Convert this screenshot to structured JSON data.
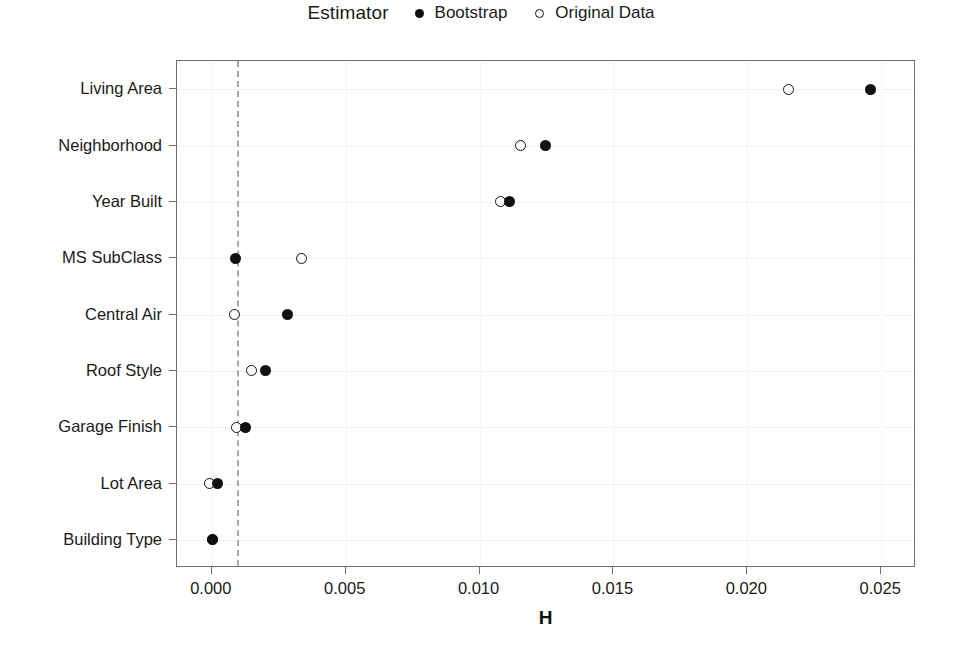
{
  "chart_data": {
    "type": "scatter",
    "title": "",
    "xlabel": "H",
    "ylabel": "",
    "xlim": [
      -0.0013,
      0.0263
    ],
    "xticks": [
      "0.000",
      "0.005",
      "0.010",
      "0.015",
      "0.020",
      "0.025"
    ],
    "xtick_values": [
      0.0,
      0.005,
      0.01,
      0.015,
      0.02,
      0.025
    ],
    "categories": [
      "Living Area",
      "Neighborhood",
      "Year Built",
      "MS SubClass",
      "Central Air",
      "Roof Style",
      "Garage Finish",
      "Lot Area",
      "Building Type"
    ],
    "series": [
      {
        "name": "Bootstrap",
        "marker": "filled-circle",
        "color": "#111111",
        "values": [
          0.0246,
          0.01245,
          0.01112,
          0.00089,
          0.00283,
          0.00202,
          0.00124,
          0.00021,
          3e-05
        ]
      },
      {
        "name": "Original Data",
        "marker": "open-circle",
        "color": "#111111",
        "values": [
          0.02153,
          0.01153,
          0.01079,
          0.00336,
          0.00085,
          0.00148,
          0.00092,
          -8e-05,
          2e-05
        ]
      }
    ],
    "reference_line": {
      "value": 0.00095,
      "style": "dashed",
      "color": "#a8a8a8",
      "orientation": "vertical"
    },
    "grid": true,
    "legend_position": "top-center"
  },
  "legend": {
    "title": "Estimator",
    "entries": [
      {
        "label": "Bootstrap",
        "marker": "filled-circle"
      },
      {
        "label": "Original Data",
        "marker": "open-circle"
      }
    ]
  }
}
